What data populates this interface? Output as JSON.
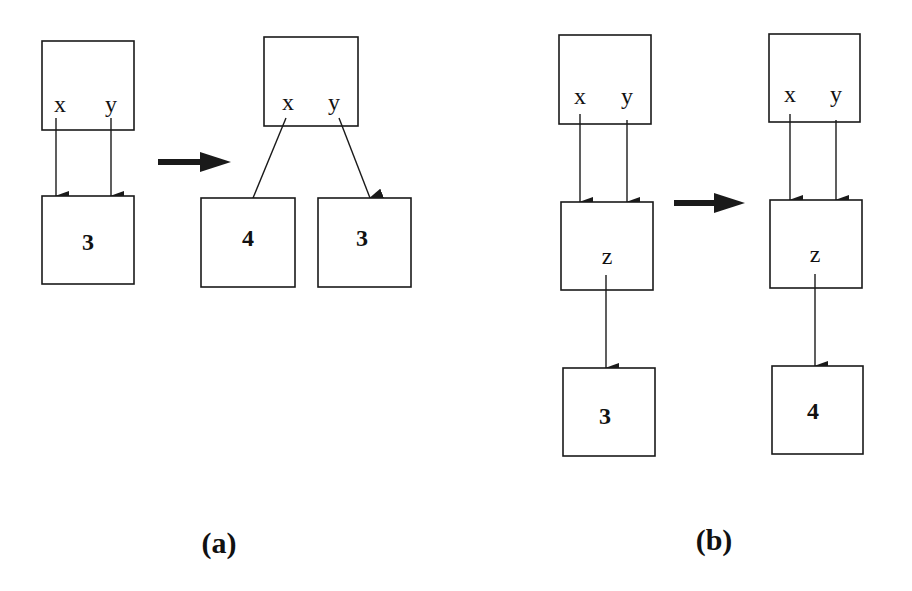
{
  "panels": {
    "a": {
      "caption": "(a)",
      "before": {
        "env_vars": [
          "x",
          "y"
        ],
        "cell_value": "3"
      },
      "after": {
        "env_vars": [
          "x",
          "y"
        ],
        "cell_x_value": "4",
        "cell_y_value": "3"
      }
    },
    "b": {
      "caption": "(b)",
      "before": {
        "env_vars": [
          "x",
          "y"
        ],
        "mid_var": "z",
        "cell_value": "3"
      },
      "after": {
        "env_vars": [
          "x",
          "y"
        ],
        "mid_var": "z",
        "cell_value": "4"
      }
    }
  },
  "colors": {
    "stroke": "#1a1a1a",
    "background": "#ffffff"
  }
}
